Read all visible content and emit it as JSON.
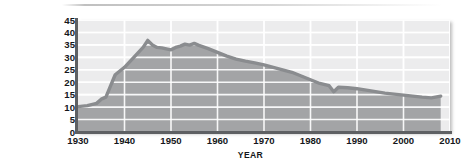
{
  "chart_data": {
    "type": "area",
    "title": "",
    "xlabel": "YEAR",
    "ylabel": "PERCENTAGE OF NONFARM WORKERS IN UNIONS",
    "ylabel_lines": [
      "PERCENTAGE OF",
      "NONFARM WORKERS",
      "IN UNIONS"
    ],
    "xlim": [
      1930,
      2010
    ],
    "ylim": [
      0,
      45
    ],
    "grid": true,
    "legend": "none",
    "xticks": [
      1930,
      1940,
      1950,
      1960,
      1970,
      1980,
      1990,
      2000,
      2010
    ],
    "xtick_labels": [
      "1930",
      "1940",
      "1950",
      "1960",
      "1970",
      "1980",
      "1990",
      "2000",
      "2010"
    ],
    "yticks": [
      0,
      5,
      10,
      15,
      20,
      25,
      30,
      35,
      40,
      45
    ],
    "ytick_labels": [
      "0",
      "5",
      "10",
      "15",
      "20",
      "25",
      "30",
      "35",
      "40",
      "45"
    ],
    "series": [
      {
        "name": "Percentage of nonfarm workers in unions",
        "x": [
          1930,
          1932,
          1934,
          1935,
          1936,
          1937,
          1938,
          1940,
          1942,
          1944,
          1945,
          1946,
          1947,
          1948,
          1950,
          1951,
          1952,
          1953,
          1954,
          1955,
          1956,
          1958,
          1960,
          1962,
          1964,
          1966,
          1968,
          1970,
          1972,
          1974,
          1976,
          1978,
          1980,
          1982,
          1984,
          1985,
          1986,
          1988,
          1990,
          1992,
          1994,
          1996,
          1998,
          2000,
          2002,
          2004,
          2006,
          2008
        ],
        "values": [
          10.2,
          10.6,
          11.5,
          13.2,
          14.0,
          18.5,
          23.0,
          26.0,
          30.0,
          34.0,
          36.8,
          35.0,
          34.0,
          33.8,
          33.0,
          34.0,
          34.5,
          35.3,
          34.9,
          35.6,
          34.8,
          33.5,
          32.0,
          30.5,
          29.3,
          28.5,
          27.8,
          27.0,
          26.0,
          25.0,
          24.0,
          22.5,
          21.0,
          19.5,
          18.6,
          16.2,
          18.0,
          17.8,
          17.4,
          16.8,
          16.2,
          15.6,
          15.2,
          14.8,
          14.4,
          14.0,
          13.7,
          14.4
        ]
      }
    ],
    "peak": {
      "year": 1945,
      "value": 36.8
    },
    "start": {
      "year": 1930,
      "value": 10.2
    },
    "end": {
      "year": 2008,
      "value": 14.4
    },
    "colors": {
      "line": "#8e9094",
      "line_dark": "#7e8083",
      "area_fill": "#a3a4a6",
      "plot_background": "#ececed",
      "gridline": "#ffffff",
      "axis": "#5e6063",
      "text": "#15171a"
    }
  }
}
